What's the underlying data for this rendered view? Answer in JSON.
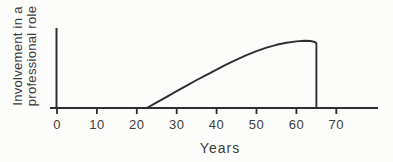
{
  "figure": {
    "background": "#fcfcfb",
    "line_color": "#2e2e2e",
    "text_color": "#3c3c3c"
  },
  "chart_data": {
    "type": "line",
    "title": "",
    "xlabel": "Years",
    "ylabel": "Involvement in a professional role",
    "ylabel_lines": [
      "Involvement in a",
      "professional role"
    ],
    "xlim": [
      0,
      81
    ],
    "ylim": [
      0,
      1
    ],
    "xticks": [
      0,
      10,
      20,
      30,
      40,
      50,
      60,
      70
    ],
    "yticks": [],
    "grid": false,
    "legend": false,
    "series": [
      {
        "name": "involvement-curve",
        "points": [
          [
            22.5,
            0
          ],
          [
            25,
            0.07
          ],
          [
            27.5,
            0.14
          ],
          [
            30,
            0.21
          ],
          [
            32.5,
            0.28
          ],
          [
            35,
            0.35
          ],
          [
            37.5,
            0.415
          ],
          [
            40,
            0.48
          ],
          [
            42.5,
            0.545
          ],
          [
            45,
            0.605
          ],
          [
            47.5,
            0.66
          ],
          [
            50,
            0.71
          ],
          [
            52.5,
            0.755
          ],
          [
            55,
            0.79
          ],
          [
            57.5,
            0.815
          ],
          [
            60,
            0.833
          ],
          [
            62,
            0.84
          ],
          [
            63.5,
            0.837
          ],
          [
            64.6,
            0.825
          ],
          [
            65,
            0.81
          ],
          [
            65,
            0
          ]
        ]
      }
    ]
  }
}
